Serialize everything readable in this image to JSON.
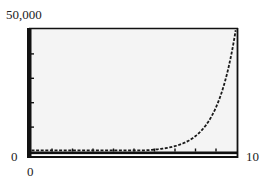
{
  "chart_data": {
    "type": "line",
    "title": "",
    "xlabel": "",
    "ylabel": "",
    "xlim": [
      0,
      10
    ],
    "ylim": [
      0,
      50000
    ],
    "tick_labels": {
      "ymax": "50,000",
      "ymin": "0",
      "xmin": "0",
      "xmax": "10"
    },
    "x_ticks": [
      1,
      2,
      3,
      4,
      5,
      6,
      7,
      8,
      9
    ],
    "y_ticks": [
      10000,
      20000,
      30000,
      40000
    ],
    "grid": false,
    "legend": null,
    "style": "graphing-calculator-screen",
    "series": [
      {
        "name": "exponential curve",
        "x": [
          0,
          1,
          2,
          3,
          4,
          5,
          6,
          6.5,
          7,
          7.5,
          8,
          8.5,
          9,
          9.5,
          9.8
        ],
        "values": [
          1,
          3,
          9,
          26,
          77,
          230,
          690,
          1190,
          2060,
          3570,
          6170,
          10700,
          18500,
          32000,
          42000
        ]
      }
    ],
    "colors": {
      "screen_background": "#f4f4f4",
      "frame": "#111111",
      "curve": "#1a1a1a"
    }
  }
}
